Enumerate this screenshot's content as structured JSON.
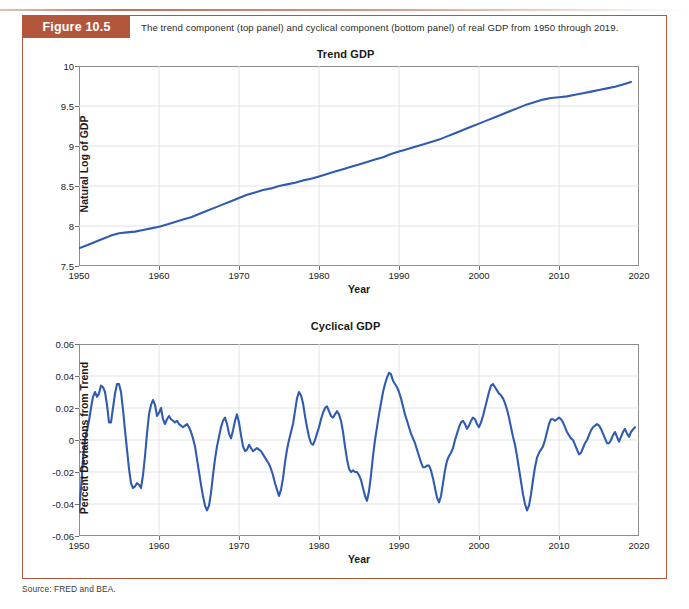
{
  "page": {
    "running_head": "",
    "figure_tag": "Figure 10.5",
    "caption": "The trend component (top panel) and cyclical component (bottom panel) of real GDP from 1950 through 2019.",
    "source": "Source: FRED and BEA.",
    "accent_color": "#b2563c",
    "line_color": "#2f5bb0"
  },
  "chart_data": [
    {
      "type": "line",
      "title": "Trend GDP",
      "xlabel": "Year",
      "ylabel": "Natural Log of GDP",
      "xlim": [
        1950,
        2020
      ],
      "ylim": [
        7.5,
        10
      ],
      "xticks": [
        1950,
        1960,
        1970,
        1980,
        1990,
        2000,
        2010,
        2020
      ],
      "yticks": [
        7.5,
        8,
        8.5,
        9,
        9.5,
        10
      ],
      "grid": true,
      "legend": "none",
      "series": [
        {
          "name": "Trend GDP",
          "color": "#2f5bb0",
          "x": [
            1950,
            1951,
            1952,
            1953,
            1954,
            1955,
            1956,
            1957,
            1958,
            1959,
            1960,
            1961,
            1962,
            1963,
            1964,
            1965,
            1966,
            1967,
            1968,
            1969,
            1970,
            1971,
            1972,
            1973,
            1974,
            1975,
            1976,
            1977,
            1978,
            1979,
            1980,
            1981,
            1982,
            1983,
            1984,
            1985,
            1986,
            1987,
            1988,
            1989,
            1990,
            1991,
            1992,
            1993,
            1994,
            1995,
            1996,
            1997,
            1998,
            1999,
            2000,
            2001,
            2002,
            2003,
            2004,
            2005,
            2006,
            2007,
            2008,
            2009,
            2010,
            2011,
            2012,
            2013,
            2014,
            2015,
            2016,
            2017,
            2018,
            2019
          ],
          "y": [
            7.72,
            7.76,
            7.8,
            7.84,
            7.88,
            7.91,
            7.92,
            7.93,
            7.95,
            7.97,
            7.99,
            8.02,
            8.05,
            8.08,
            8.11,
            8.15,
            8.19,
            8.23,
            8.27,
            8.31,
            8.35,
            8.39,
            8.42,
            8.45,
            8.47,
            8.5,
            8.52,
            8.54,
            8.57,
            8.59,
            8.62,
            8.65,
            8.68,
            8.71,
            8.74,
            8.77,
            8.8,
            8.83,
            8.86,
            8.9,
            8.93,
            8.96,
            8.99,
            9.02,
            9.05,
            9.08,
            9.12,
            9.16,
            9.2,
            9.24,
            9.28,
            9.32,
            9.36,
            9.4,
            9.44,
            9.48,
            9.52,
            9.55,
            9.58,
            9.6,
            9.61,
            9.62,
            9.64,
            9.66,
            9.68,
            9.7,
            9.72,
            9.74,
            9.77,
            9.8
          ]
        }
      ]
    },
    {
      "type": "line",
      "title": "Cyclical GDP",
      "xlabel": "Year",
      "ylabel": "Percent Deviations from Trend",
      "xlim": [
        1950,
        2020
      ],
      "ylim": [
        -0.06,
        0.06
      ],
      "xticks": [
        1950,
        1960,
        1970,
        1980,
        1990,
        2000,
        2010,
        2020
      ],
      "yticks": [
        -0.06,
        -0.04,
        -0.02,
        0,
        0.02,
        0.04,
        0.06
      ],
      "grid": true,
      "legend": "none",
      "series": [
        {
          "name": "Cyclical GDP",
          "color": "#2f5bb0",
          "x": [
            1950.0,
            1950.25,
            1950.5,
            1950.75,
            1951.0,
            1951.25,
            1951.5,
            1951.75,
            1952.0,
            1952.25,
            1952.5,
            1952.75,
            1953.0,
            1953.25,
            1953.5,
            1953.75,
            1954.0,
            1954.25,
            1954.5,
            1954.75,
            1955.0,
            1955.25,
            1955.5,
            1955.75,
            1956.0,
            1956.25,
            1956.5,
            1956.75,
            1957.0,
            1957.25,
            1957.5,
            1957.75,
            1958.0,
            1958.25,
            1958.5,
            1958.75,
            1959.0,
            1959.25,
            1959.5,
            1959.75,
            1960.0,
            1960.25,
            1960.5,
            1960.75,
            1961.0,
            1961.25,
            1961.5,
            1961.75,
            1962.0,
            1962.25,
            1962.5,
            1962.75,
            1963.0,
            1963.25,
            1963.5,
            1963.75,
            1964.0,
            1964.25,
            1964.5,
            1964.75,
            1965.0,
            1965.25,
            1965.5,
            1965.75,
            1966.0,
            1966.25,
            1966.5,
            1966.75,
            1967.0,
            1967.25,
            1967.5,
            1967.75,
            1968.0,
            1968.25,
            1968.5,
            1968.75,
            1969.0,
            1969.25,
            1969.5,
            1969.75,
            1970.0,
            1970.25,
            1970.5,
            1970.75,
            1971.0,
            1971.25,
            1971.5,
            1971.75,
            1972.0,
            1972.25,
            1972.5,
            1972.75,
            1973.0,
            1973.25,
            1973.5,
            1973.75,
            1974.0,
            1974.25,
            1974.5,
            1974.75,
            1975.0,
            1975.25,
            1975.5,
            1975.75,
            1976.0,
            1976.25,
            1976.5,
            1976.75,
            1977.0,
            1977.25,
            1977.5,
            1977.75,
            1978.0,
            1978.25,
            1978.5,
            1978.75,
            1979.0,
            1979.25,
            1979.5,
            1979.75,
            1980.0,
            1980.25,
            1980.5,
            1980.75,
            1981.0,
            1981.25,
            1981.5,
            1981.75,
            1982.0,
            1982.25,
            1982.5,
            1982.75,
            1983.0,
            1983.25,
            1983.5,
            1983.75,
            1984.0,
            1984.25,
            1984.5,
            1984.75,
            1985.0,
            1985.25,
            1985.5,
            1985.75,
            1986.0,
            1986.25,
            1986.5,
            1986.75,
            1987.0,
            1987.25,
            1987.5,
            1987.75,
            1988.0,
            1988.25,
            1988.5,
            1988.75,
            1989.0,
            1989.25,
            1989.5,
            1989.75,
            1990.0,
            1990.25,
            1990.5,
            1990.75,
            1991.0,
            1991.25,
            1991.5,
            1991.75,
            1992.0,
            1992.25,
            1992.5,
            1992.75,
            1993.0,
            1993.25,
            1993.5,
            1993.75,
            1994.0,
            1994.25,
            1994.5,
            1994.75,
            1995.0,
            1995.25,
            1995.5,
            1995.75,
            1996.0,
            1996.25,
            1996.5,
            1996.75,
            1997.0,
            1997.25,
            1997.5,
            1997.75,
            1998.0,
            1998.25,
            1998.5,
            1998.75,
            1999.0,
            1999.25,
            1999.5,
            1999.75,
            2000.0,
            2000.25,
            2000.5,
            2000.75,
            2001.0,
            2001.25,
            2001.5,
            2001.75,
            2002.0,
            2002.25,
            2002.5,
            2002.75,
            2003.0,
            2003.25,
            2003.5,
            2003.75,
            2004.0,
            2004.25,
            2004.5,
            2004.75,
            2005.0,
            2005.25,
            2005.5,
            2005.75,
            2006.0,
            2006.25,
            2006.5,
            2006.75,
            2007.0,
            2007.25,
            2007.5,
            2007.75,
            2008.0,
            2008.25,
            2008.5,
            2008.75,
            2009.0,
            2009.25,
            2009.5,
            2009.75,
            2010.0,
            2010.25,
            2010.5,
            2010.75,
            2011.0,
            2011.25,
            2011.5,
            2011.75,
            2012.0,
            2012.25,
            2012.5,
            2012.75,
            2013.0,
            2013.25,
            2013.5,
            2013.75,
            2014.0,
            2014.25,
            2014.5,
            2014.75,
            2015.0,
            2015.25,
            2015.5,
            2015.75,
            2016.0,
            2016.25,
            2016.5,
            2016.75,
            2017.0,
            2017.25,
            2017.5,
            2017.75,
            2018.0,
            2018.25,
            2018.5,
            2018.75,
            2019.0,
            2019.5
          ],
          "y": [
            -0.045,
            -0.03,
            -0.012,
            0.0,
            0.006,
            0.012,
            0.02,
            0.027,
            0.03,
            0.027,
            0.029,
            0.034,
            0.033,
            0.03,
            0.022,
            0.011,
            0.011,
            0.02,
            0.029,
            0.035,
            0.035,
            0.03,
            0.019,
            0.006,
            -0.006,
            -0.018,
            -0.027,
            -0.03,
            -0.029,
            -0.027,
            -0.028,
            -0.03,
            -0.022,
            -0.01,
            0.004,
            0.016,
            0.022,
            0.025,
            0.022,
            0.015,
            0.017,
            0.02,
            0.013,
            0.01,
            0.013,
            0.015,
            0.013,
            0.012,
            0.011,
            0.012,
            0.01,
            0.009,
            0.008,
            0.009,
            0.01,
            0.008,
            0.005,
            0.001,
            -0.004,
            -0.012,
            -0.02,
            -0.028,
            -0.035,
            -0.041,
            -0.044,
            -0.041,
            -0.033,
            -0.022,
            -0.012,
            -0.004,
            0.002,
            0.008,
            0.012,
            0.014,
            0.01,
            0.004,
            0.001,
            0.006,
            0.012,
            0.016,
            0.011,
            0.003,
            -0.004,
            -0.007,
            -0.006,
            -0.003,
            -0.005,
            -0.007,
            -0.006,
            -0.005,
            -0.006,
            -0.007,
            -0.009,
            -0.011,
            -0.013,
            -0.015,
            -0.018,
            -0.022,
            -0.027,
            -0.031,
            -0.035,
            -0.031,
            -0.024,
            -0.014,
            -0.006,
            0.0,
            0.005,
            0.01,
            0.018,
            0.026,
            0.03,
            0.028,
            0.023,
            0.015,
            0.008,
            0.002,
            -0.002,
            -0.003,
            0.0,
            0.004,
            0.008,
            0.013,
            0.017,
            0.02,
            0.021,
            0.018,
            0.015,
            0.014,
            0.016,
            0.018,
            0.016,
            0.012,
            0.005,
            -0.004,
            -0.012,
            -0.018,
            -0.02,
            -0.019,
            -0.02,
            -0.02,
            -0.022,
            -0.025,
            -0.03,
            -0.035,
            -0.038,
            -0.032,
            -0.022,
            -0.01,
            0.0,
            0.008,
            0.016,
            0.023,
            0.03,
            0.035,
            0.039,
            0.042,
            0.041,
            0.037,
            0.035,
            0.033,
            0.03,
            0.026,
            0.021,
            0.016,
            0.012,
            0.008,
            0.004,
            0.001,
            -0.002,
            -0.006,
            -0.01,
            -0.014,
            -0.017,
            -0.017,
            -0.016,
            -0.016,
            -0.019,
            -0.024,
            -0.03,
            -0.036,
            -0.039,
            -0.035,
            -0.027,
            -0.019,
            -0.013,
            -0.01,
            -0.008,
            -0.005,
            0.0,
            0.004,
            0.008,
            0.011,
            0.012,
            0.01,
            0.007,
            0.009,
            0.012,
            0.014,
            0.013,
            0.01,
            0.008,
            0.011,
            0.015,
            0.02,
            0.025,
            0.03,
            0.034,
            0.035,
            0.033,
            0.031,
            0.029,
            0.028,
            0.026,
            0.023,
            0.019,
            0.014,
            0.008,
            0.002,
            -0.003,
            -0.01,
            -0.018,
            -0.026,
            -0.034,
            -0.04,
            -0.044,
            -0.041,
            -0.034,
            -0.025,
            -0.017,
            -0.011,
            -0.008,
            -0.006,
            -0.004,
            0.0,
            0.005,
            0.01,
            0.013,
            0.013,
            0.012,
            0.013,
            0.014,
            0.013,
            0.011,
            0.008,
            0.005,
            0.003,
            0.001,
            0.0,
            -0.003,
            -0.006,
            -0.009,
            -0.008,
            -0.005,
            -0.002,
            0.0,
            0.003,
            0.006,
            0.008,
            0.009,
            0.01,
            0.009,
            0.007,
            0.004,
            0.001,
            -0.002,
            -0.002,
            0.0,
            0.003,
            0.005,
            0.002,
            -0.001,
            0.002,
            0.005,
            0.007,
            0.004,
            0.002,
            0.005,
            0.008,
            0.009,
            0.01,
            0.008,
            0.006,
            0.003,
            0.001,
            0.0,
            0.002,
            0.005,
            0.008,
            0.01,
            0.012,
            0.011,
            0.009,
            0.011,
            0.013,
            0.012
          ]
        }
      ]
    }
  ]
}
